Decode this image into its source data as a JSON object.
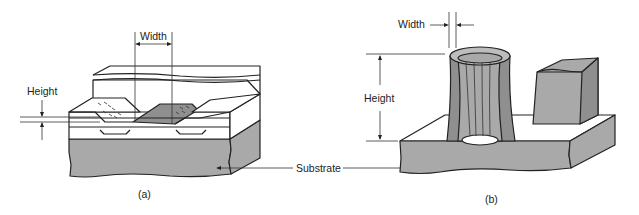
{
  "figure": {
    "panel_a": {
      "caption": "(a)",
      "labels": {
        "width": "Width",
        "height": "Height"
      }
    },
    "panel_b": {
      "caption": "(b)",
      "labels": {
        "width": "Width",
        "height": "Height"
      }
    },
    "shared_labels": {
      "substrate": "Substrate"
    },
    "colors": {
      "line": "#222222",
      "substrate_gray": "#a9a9a9",
      "film_dark_gray": "#8f8f8f",
      "background": "#ffffff"
    }
  }
}
